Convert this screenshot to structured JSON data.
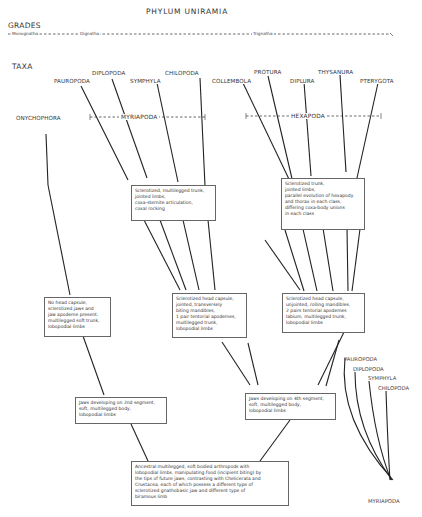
{
  "title": "PHYLUM UNIRAMIA",
  "grades": {
    "heading": "GRADES",
    "items": [
      "Monognatha",
      "Dignatha",
      "Trignatha"
    ]
  },
  "taxa": {
    "heading": "TAXA",
    "onychophora": "ONYCHOPHORA",
    "myriapoda_group": "MYRIAPODA",
    "hexapoda_group": "HEXAPODA",
    "myriapod_classes": [
      "PAUROPODA",
      "DIPLOPODA",
      "SYMPHYLA",
      "CHILOPODA"
    ],
    "hexapod_classes": [
      "COLLEMBOLA",
      "PROTURA",
      "DIPLURA",
      "THYSANURA",
      "PTERYGOTA"
    ]
  },
  "boxes": {
    "myriapod_trunk": [
      "Sclerotized, multilegged trunk,",
      "jointed limbs,",
      "coxa-sternite articulation,",
      "coxal rocking"
    ],
    "hexapod_trunk": [
      "Sclerotized trunk,",
      "jointed limbs,",
      "parallel evolution of hexapody",
      "and thorax in each class,",
      "differing coxa-body unions",
      "in each class"
    ],
    "onychophora_head": [
      "No head capsule,",
      "sclerotized jaws and",
      "jaw apodeme present,",
      "multilegged soft trunk,",
      "lobopodial limbs"
    ],
    "myriapod_head": [
      "Sclerotized head capsule,",
      "jointed, transversely",
      "biting mandibles,",
      "1 pair tentorial apodemes,",
      "multilegged trunk,",
      "lobopodial limbs"
    ],
    "hexapod_head": [
      "Sclerotized head capsule,",
      "unjointed, rolling mandibles,",
      "2 pairs tentorial apodemes",
      "labium, multilegged trunk,",
      "lobopodial limbs"
    ],
    "jaws_2nd": [
      "Jaws developing on 2nd segment,",
      "soft, multilegged body,",
      "lobopodial limbs"
    ],
    "jaws_4th": [
      "Jaws developing on 4th segment,",
      "soft, multilegged body,",
      "lobopodial limbs"
    ],
    "ancestral": [
      "Ancestral multilegged, soft bodied arthropods with",
      "lobopodial limbs, manipulating food (incipient biting) by",
      "the tips of future jaws, contrasting with Chelicerata and",
      "Crustacea, each of which possess a different type of",
      "sclerotized gnathobasic jaw and different type of",
      "biramous limb"
    ]
  },
  "inset": {
    "classes": [
      "PAUROPODA",
      "DIPLOPODA",
      "SYMPHYLA",
      "CHILOPODA"
    ],
    "root": "MYRIAPODA"
  }
}
